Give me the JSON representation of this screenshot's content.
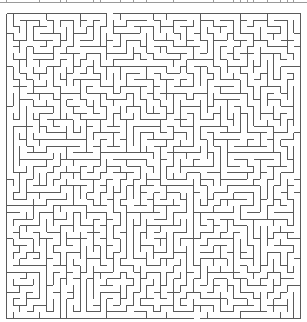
{
  "maze": {
    "origin_x": 6.5,
    "origin_y": 13.5,
    "width_px": 294,
    "height_px": 305,
    "cols": 44,
    "rows": 46,
    "line_color": "#5a5a5a",
    "line_width": 1,
    "seed": 12345,
    "entrance": {
      "side": "top",
      "col": 15
    },
    "exit": {
      "side": "bottom",
      "col": 28
    }
  },
  "top_strip": {
    "y": 2,
    "line_color": "#9a9a9a"
  }
}
